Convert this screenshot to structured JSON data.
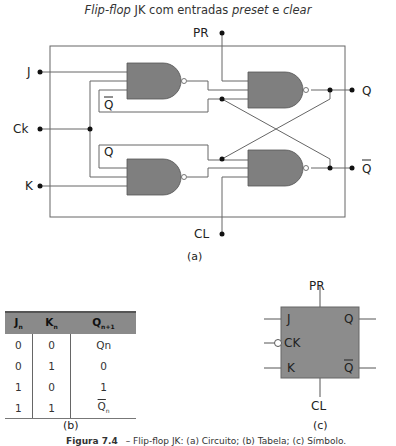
{
  "title": {
    "italic_1": "Flip-flop",
    "text_1": " JK com entradas ",
    "italic_2": "preset",
    "text_2": " e ",
    "italic_3": "clear"
  },
  "circuit": {
    "inputs": {
      "preset": "PR",
      "clear": "CL",
      "j": "J",
      "clock": "Ck",
      "k": "K"
    },
    "outputs": {
      "q": "Q",
      "q_bar": "Q"
    },
    "feedback_labels": {
      "top": "Q",
      "bottom": "Q"
    },
    "gate_fill": "#7f7f7f",
    "caption": "(a)"
  },
  "truth_table": {
    "headers": [
      {
        "main": "J",
        "sub": "n"
      },
      {
        "main": "K",
        "sub": "n"
      },
      {
        "main": "Q",
        "sub": "n+1"
      }
    ],
    "rows": [
      [
        "0",
        "0",
        "Qn"
      ],
      [
        "0",
        "1",
        "0"
      ],
      [
        "1",
        "0",
        "1"
      ],
      [
        "1",
        "1",
        "Q"
      ]
    ],
    "last_row_q_sub": "n",
    "caption": "(b)"
  },
  "symbol": {
    "top": "PR",
    "bottom": "CL",
    "left": [
      "J",
      "CK",
      "K"
    ],
    "right": [
      "Q",
      "Q"
    ],
    "fill": "#8c8c8c",
    "caption": "(c)"
  },
  "figure_caption": {
    "label": "Figura 7.4",
    "text": "– Flip-flop JK: (a) Circuito; (b) Tabela; (c) Símbolo."
  }
}
